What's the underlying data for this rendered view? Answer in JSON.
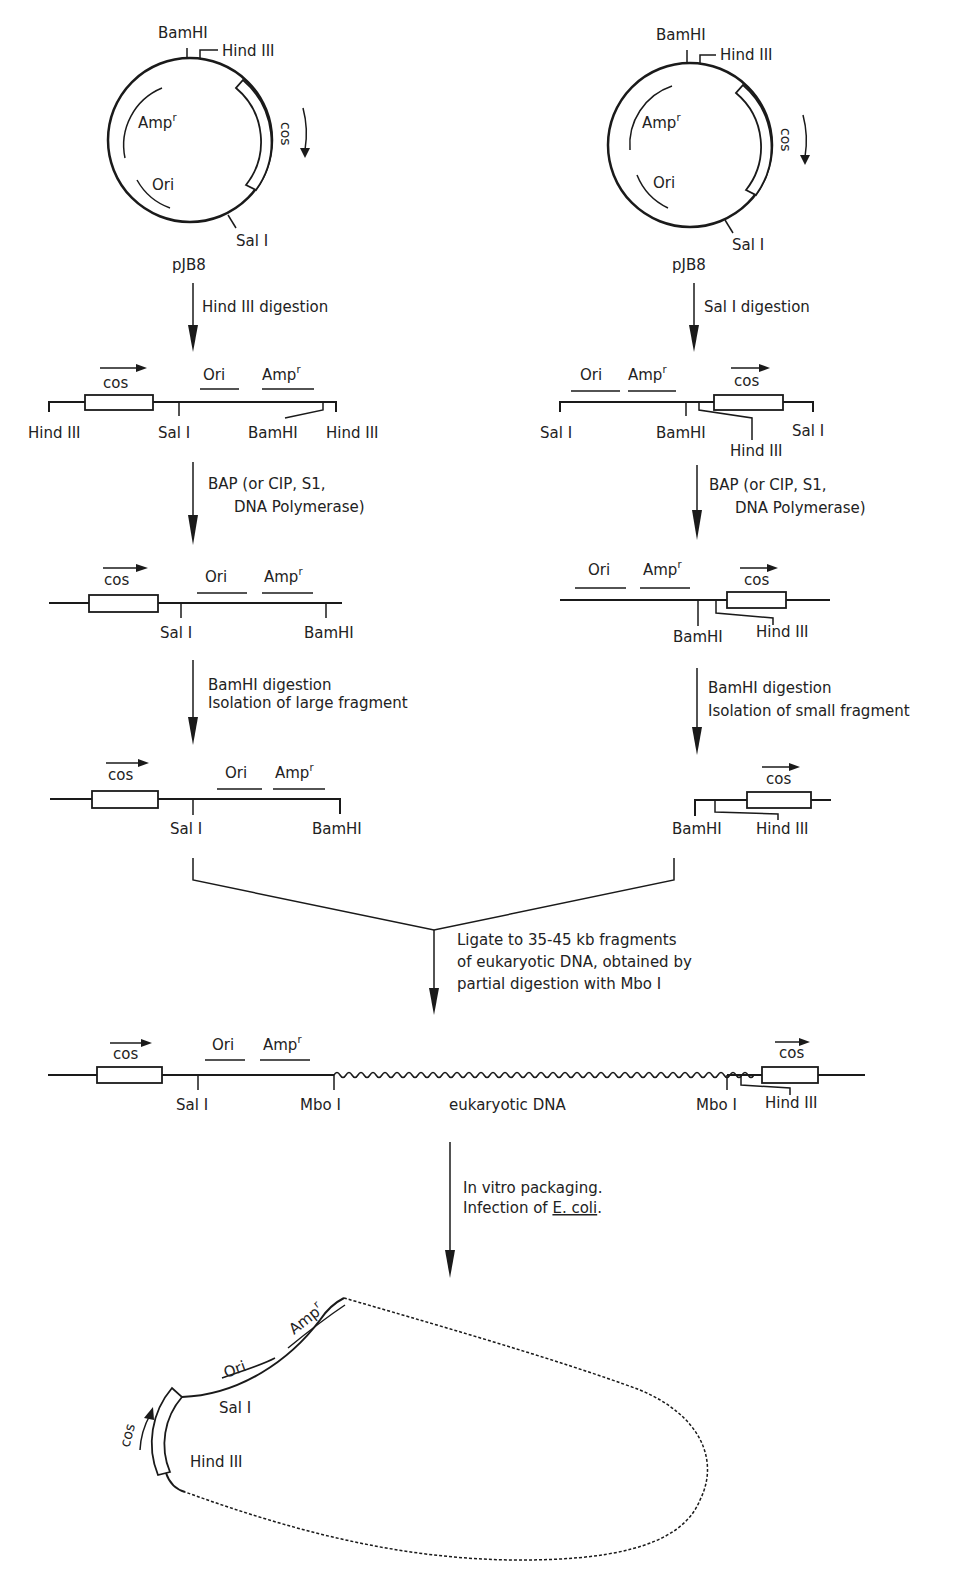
{
  "figure": {
    "plasmid_left": {
      "name": "pJB8",
      "sites": {
        "top1": "BamHI",
        "top2": "Hind III",
        "bottom": "Sal I"
      },
      "features": {
        "amp": "Amp",
        "amp_sup": "r",
        "ori": "Ori",
        "cos": "cos"
      }
    },
    "plasmid_right": {
      "name": "pJB8",
      "sites": {
        "top1": "BamHI",
        "top2": "Hind III",
        "bottom": "Sal I"
      },
      "features": {
        "amp": "Amp",
        "amp_sup": "r",
        "ori": "Ori",
        "cos": "cos"
      }
    },
    "left_branch": {
      "step1": "Hind III digestion",
      "map1": {
        "cos": "cos",
        "ori": "Ori",
        "amp": "Amp",
        "amp_sup": "r",
        "sites": [
          "Hind III",
          "Sal I",
          "BamHI",
          "Hind III"
        ]
      },
      "step2_line1": "BAP (or CIP, S1,",
      "step2_line2": "DNA Polymerase)",
      "map2": {
        "cos": "cos",
        "ori": "Ori",
        "amp": "Amp",
        "amp_sup": "r",
        "sites": [
          "Sal I",
          "BamHI"
        ]
      },
      "step3_line1": "BamHI digestion",
      "step3_line2": "Isolation of large fragment",
      "map3": {
        "cos": "cos",
        "ori": "Ori",
        "amp": "Amp",
        "amp_sup": "r",
        "sites": [
          "Sal I",
          "BamHI"
        ]
      }
    },
    "right_branch": {
      "step1": "Sal I digestion",
      "map1": {
        "cos": "cos",
        "ori": "Ori",
        "amp": "Amp",
        "amp_sup": "r",
        "sites": [
          "Sal I",
          "BamHI",
          "Hind III",
          "Sal I"
        ]
      },
      "step2_line1": "BAP (or CIP, S1,",
      "step2_line2": "DNA Polymerase)",
      "map2": {
        "cos": "cos",
        "ori": "Ori",
        "amp": "Amp",
        "amp_sup": "r",
        "sites": [
          "BamHI",
          "Hind III"
        ]
      },
      "step3_line1": "BamHI digestion",
      "step3_line2": "Isolation of small fragment",
      "map3": {
        "cos": "cos",
        "sites": [
          "BamHI",
          "Hind III"
        ]
      }
    },
    "ligation": {
      "line1": "Ligate to 35-45 kb fragments",
      "line2": "of eukaryotic DNA, obtained by",
      "line3": "partial digestion with Mbo I"
    },
    "recombinant": {
      "cos_left": "cos",
      "ori": "Ori",
      "amp": "Amp",
      "amp_sup": "r",
      "sites": [
        "Sal I",
        "Mbo I",
        "Mbo I",
        "Hind III"
      ],
      "insert_label": "eukaryotic DNA",
      "cos_right": "cos"
    },
    "packaging": {
      "line1": "In vitro packaging.",
      "line2_prefix": "Infection of ",
      "line2_organism": "E. coli",
      "line2_suffix": "."
    },
    "final_cosmid": {
      "cos": "cos",
      "ori": "Ori",
      "amp": "Amp",
      "amp_sup": "r",
      "sites": [
        "Sal I",
        "Hind III"
      ]
    }
  }
}
